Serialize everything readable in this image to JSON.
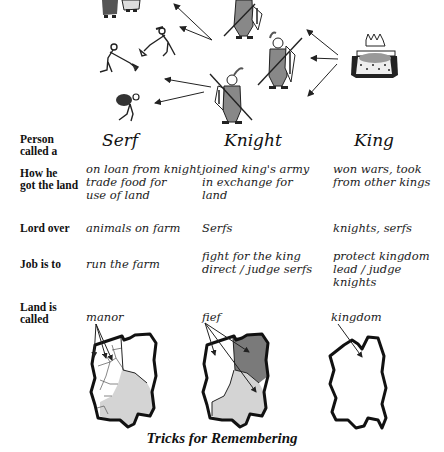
{
  "illustration": {
    "figures": [
      "serf-couple-icon",
      "serf-digging-icon",
      "serf-hoeing-icon",
      "serf-carrying-sack-icon",
      "knight-icon",
      "knight-icon",
      "knight-icon",
      "king-icon"
    ],
    "arrows_description": "King gives land to knights; knights give land to serfs"
  },
  "table": {
    "columns": [
      "Serf",
      "Knight",
      "King"
    ],
    "rows": [
      {
        "label": "Person called a",
        "label_lines": [
          "Person",
          "called a"
        ],
        "cells": [
          "Serf",
          "Knight",
          "King"
        ]
      },
      {
        "label": "How he got the land",
        "label_lines": [
          "How he",
          "got the land"
        ],
        "cells": [
          [
            "on loan from knight",
            "trade food for",
            "use of land"
          ],
          [
            "joined king's army",
            "in exchange for",
            "land"
          ],
          [
            "won wars, took",
            "from other kings"
          ]
        ]
      },
      {
        "label": "Lord over",
        "label_lines": [
          "Lord over"
        ],
        "cells": [
          [
            "animals on farm"
          ],
          [
            "Serfs"
          ],
          [
            "knights, serfs"
          ]
        ]
      },
      {
        "label": "Job is to",
        "label_lines": [
          "Job is to"
        ],
        "cells": [
          [
            "run the farm"
          ],
          [
            "fight for the king",
            "direct / judge serfs"
          ],
          [
            "protect kingdom",
            "lead / judge knights"
          ]
        ]
      },
      {
        "label": "Land is called",
        "label_lines": [
          "Land is",
          "called"
        ],
        "cells": [
          [
            "manor"
          ],
          [
            "fief"
          ],
          [
            "kingdom"
          ]
        ]
      }
    ]
  },
  "maps": [
    {
      "name": "manor-map",
      "label": "manor"
    },
    {
      "name": "fief-map",
      "label": "fief"
    },
    {
      "name": "kingdom-map",
      "label": "kingdom"
    }
  ],
  "caption": "Tricks for Remembering",
  "colors": {
    "dark_region": "#7a7a7a",
    "light_region": "#d4d4d4",
    "outline": "#111111"
  }
}
